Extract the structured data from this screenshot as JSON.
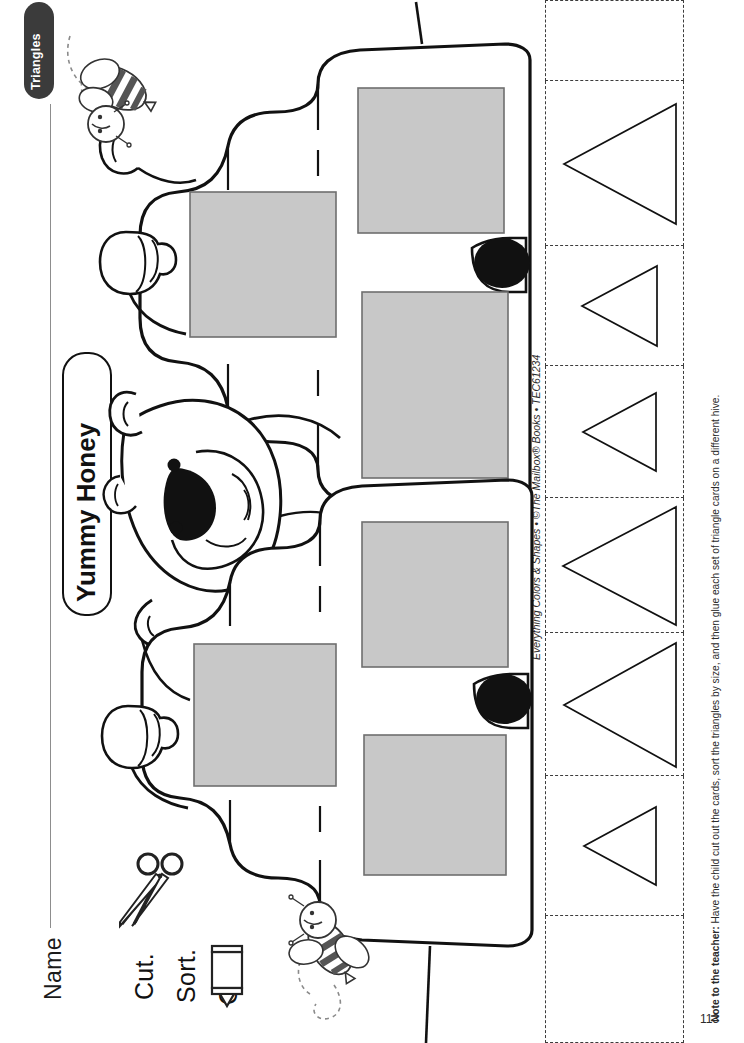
{
  "worksheet": {
    "topic_tab": "Triangles",
    "name_label": "Name",
    "sign_label": "Yummy Honey",
    "page_number": "113",
    "copyright": "Everything Colors & Shapes • ©The Mailbox® Books • TEC61234",
    "teacher_note_prefix": "Note to the teacher:",
    "teacher_note_body": " Have the child cut out the cards, sort the triangles by size, and then glue each set of triangle cards on a different hive."
  },
  "instructions": [
    {
      "id": "cut",
      "label": "Cut.",
      "icon": "scissors-icon"
    },
    {
      "id": "sort",
      "label": "Sort.",
      "icon": "none"
    },
    {
      "id": "glue",
      "label": "Glue.",
      "icon": "glue-bottle-icon"
    }
  ],
  "colors": {
    "tab_background": "#3b3b3b",
    "tab_text": "#ffffff",
    "ink": "#111111",
    "glue_square_fill": "#c8c8c8",
    "glue_square_stroke": "#6f6f6f",
    "cut_line": "#3c3c3c",
    "paper": "#ffffff"
  },
  "hives": [
    {
      "id": "hive-top",
      "label": "beehive-top",
      "glue_squares": [
        {
          "id": "hive-top-square-left",
          "x": 190,
          "y": 192,
          "w": 146,
          "h": 145
        },
        {
          "id": "hive-top-square-upper",
          "x": 358,
          "y": 88,
          "w": 146,
          "h": 145
        },
        {
          "id": "hive-top-square-lower",
          "x": 362,
          "y": 292,
          "w": 146,
          "h": 185
        }
      ],
      "entrance": {
        "id": "hive-top-entrance",
        "cx": 498,
        "cy": 264,
        "rx": 26,
        "ry": 17
      }
    },
    {
      "id": "hive-bottom",
      "label": "beehive-bottom",
      "glue_squares": [
        {
          "id": "hive-bottom-square-left",
          "x": 194,
          "y": 644,
          "w": 142,
          "h": 142
        },
        {
          "id": "hive-bottom-square-upper",
          "x": 362,
          "y": 522,
          "w": 146,
          "h": 145
        },
        {
          "id": "hive-bottom-square-lower",
          "x": 364,
          "y": 735,
          "w": 142,
          "h": 140
        }
      ],
      "entrance": {
        "id": "hive-bottom-entrance",
        "cx": 500,
        "cy": 700,
        "rx": 26,
        "ry": 17
      }
    }
  ],
  "bears": [
    {
      "id": "bear-top",
      "label": "bear-peeking-top"
    },
    {
      "id": "bear-bottom",
      "label": "bear-peeking-bottom"
    }
  ],
  "bees": [
    {
      "id": "bee-top",
      "label": "flying-bee-top"
    },
    {
      "id": "bee-bottom",
      "label": "flying-bee-bottom"
    }
  ],
  "cut_cards": {
    "column_left": 545,
    "column_width": 139,
    "cells": [
      {
        "id": "card-blank-top",
        "top": 0,
        "height": 81,
        "triangle": null
      },
      {
        "id": "card-1",
        "top": 81,
        "height": 165,
        "triangle": {
          "w": 112,
          "h": 120,
          "label": "large-triangle"
        }
      },
      {
        "id": "card-2",
        "top": 246,
        "height": 120,
        "triangle": {
          "w": 75,
          "h": 80,
          "label": "small-triangle"
        }
      },
      {
        "id": "card-3",
        "top": 366,
        "height": 132,
        "triangle": {
          "w": 73,
          "h": 78,
          "label": "small-triangle"
        }
      },
      {
        "id": "card-4",
        "top": 498,
        "height": 135,
        "triangle": {
          "w": 113,
          "h": 118,
          "label": "large-triangle"
        }
      },
      {
        "id": "card-5",
        "top": 633,
        "height": 143,
        "triangle": {
          "w": 112,
          "h": 124,
          "label": "large-triangle"
        }
      },
      {
        "id": "card-6",
        "top": 776,
        "height": 140,
        "triangle": {
          "w": 72,
          "h": 78,
          "label": "small-triangle"
        }
      },
      {
        "id": "card-blank-bottom",
        "top": 916,
        "height": 127,
        "triangle": null
      }
    ],
    "triangle_orientation": "pointing-left"
  }
}
